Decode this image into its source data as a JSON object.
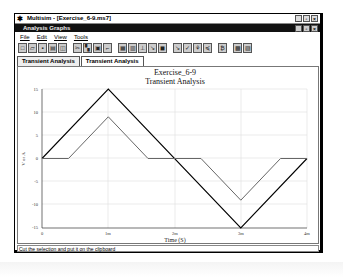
{
  "window": {
    "title": "Multisim - [Exercise_6-9.ms7]",
    "subwindow_title": "Analysis Graphs",
    "controls": [
      "minimize",
      "restore",
      "close"
    ]
  },
  "menu": [
    "File",
    "Edit",
    "View",
    "Tools"
  ],
  "toolbar": {
    "buttons": [
      "new-icon",
      "open-icon",
      "save-icon",
      "print-icon",
      "print-preview-icon",
      "cut-icon",
      "copy-icon",
      "paste-icon",
      "paste-special-icon",
      "grid-icon",
      "legend-icon",
      "cursors-icon",
      "zoom-icon",
      "restore-zoom-icon",
      "reverse-colors-icon",
      "properties-icon",
      "overlay-traces-icon",
      "add-trace-icon",
      "export-icon",
      "export-excel-icon"
    ]
  },
  "tabs": [
    {
      "label": "Transient Analysis",
      "active": true
    },
    {
      "label": "Transient Analysis",
      "active": false
    }
  ],
  "status": "Cut the selection and put it on the clipboard",
  "chart_data": {
    "type": "line",
    "title": "Exercise_6-9",
    "subtitle": "Transient Analysis",
    "xlabel": "Time (S)",
    "ylabel": "V or A",
    "xlim": [
      0,
      4
    ],
    "ylim": [
      -15,
      15
    ],
    "x_ticks": [
      "0",
      "1m",
      "2m",
      "3m",
      "4m"
    ],
    "y_ticks": [
      "15",
      "10",
      "5",
      "0",
      "-5",
      "-10",
      "-15"
    ],
    "grid": true,
    "series": [
      {
        "name": "input",
        "color": "#000000",
        "x": [
          0,
          1,
          3,
          4
        ],
        "y": [
          0,
          15,
          -15,
          0
        ]
      },
      {
        "name": "output",
        "color": "#666666",
        "x": [
          0,
          0.4,
          1,
          1.6,
          2.4,
          3,
          3.6,
          4
        ],
        "y": [
          0,
          0,
          9,
          0,
          0,
          -9,
          0,
          0
        ]
      }
    ]
  }
}
